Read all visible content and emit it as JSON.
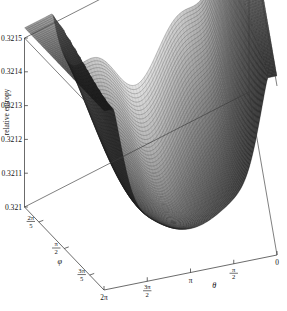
{
  "figure": {
    "type": "surface-plot-3d",
    "background": "#ffffff",
    "line_color": "#2b2b2b"
  },
  "chart_data": {
    "type": "surface",
    "title": "",
    "zlabel": "relative entropy",
    "xlabel": "θ",
    "ylabel": "φ",
    "zlim": [
      0.321,
      0.3215
    ],
    "zticks": [
      "0.3215",
      "0.3214",
      "0.3213",
      "0.3212",
      "0.3211",
      "0.321"
    ],
    "ztick_values": [
      0.3215,
      0.3214,
      0.3213,
      0.3212,
      0.3211,
      0.321
    ],
    "xticks": [
      "2π",
      "3π/2",
      "π",
      "π/2",
      "0"
    ],
    "xtick_values": [
      6.2832,
      4.7124,
      3.1416,
      1.5708,
      0
    ],
    "yticks": [
      "2π/5",
      "π/2",
      "3π/5"
    ],
    "ytick_values": [
      1.2566,
      1.5708,
      1.885
    ],
    "grid": false,
    "legend": false,
    "shading": "grayscale",
    "mesh": "horizontal-contour-bands",
    "features": [
      {
        "name": "left-peak",
        "theta": "2π",
        "approx_z": 0.32135
      },
      {
        "name": "right-peak",
        "theta": "0",
        "approx_z": 0.32147
      },
      {
        "name": "interior-hump-left",
        "theta": "4π/3",
        "approx_z": 0.32128
      },
      {
        "name": "interior-hump-right",
        "theta": "2π/3",
        "approx_z": 0.32131
      },
      {
        "name": "central-saddle",
        "theta": "π",
        "approx_z": 0.32125
      },
      {
        "name": "front-basin",
        "theta": "π",
        "approx_z": 0.32105
      }
    ]
  },
  "axis_titles": {
    "z": "relative entropy",
    "x": "θ",
    "y": "φ"
  },
  "z_ticks": [
    {
      "label": "0.3215"
    },
    {
      "label": "0.3214"
    },
    {
      "label": "0.3213"
    },
    {
      "label": "0.3212"
    },
    {
      "label": "0.3211"
    },
    {
      "label": "0.321"
    }
  ],
  "x_ticks": [
    {
      "label": "2π",
      "kind": "plain"
    },
    {
      "num": "3π",
      "den": "2",
      "kind": "fraction"
    },
    {
      "label": "π",
      "kind": "plain"
    },
    {
      "num": "π",
      "den": "2",
      "kind": "fraction"
    },
    {
      "label": "0",
      "kind": "plain"
    }
  ],
  "y_ticks": [
    {
      "num": "2π",
      "den": "5",
      "kind": "fraction"
    },
    {
      "num": "π",
      "den": "2",
      "kind": "fraction"
    },
    {
      "num": "3π",
      "den": "5",
      "kind": "fraction"
    }
  ]
}
